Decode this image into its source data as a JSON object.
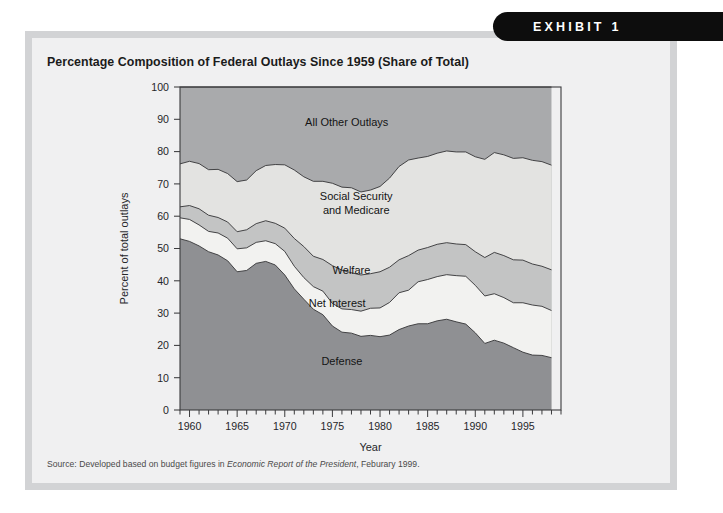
{
  "badge": {
    "label": "EXHIBIT 1"
  },
  "title": "Percentage Composition of Federal Outlays Since 1959 (Share of Total)",
  "source": {
    "prefix": "Source: Developed based on budget figures in ",
    "italic": "Economic Report of the President",
    "suffix": ", Feburary 1999."
  },
  "colors": {
    "page_background": "#ffffff",
    "frame": "#d2d3d5",
    "panel": "#f0f0f1",
    "badge": "#0d0d0d",
    "defense": "#8f9093",
    "net_interest": "#f2f2f0",
    "welfare": "#c3c4c4",
    "social_security": "#e3e3e1",
    "all_other": "#a9aaac",
    "outline": "#3b3b3d",
    "axis": "#3b3b3d"
  },
  "chart_data": {
    "type": "area",
    "title": "Percentage Composition of Federal Outlays Since 1959 (Share of Total)",
    "xlabel": "Year",
    "ylabel": "Percent of total outlays",
    "xlim": [
      1959,
      1999
    ],
    "ylim": [
      0,
      100
    ],
    "grid": false,
    "legend": "inline-band-labels",
    "stacked": true,
    "ytick_labels": [
      "0",
      "10",
      "20",
      "30",
      "40",
      "50",
      "60",
      "70",
      "80",
      "90",
      "100"
    ],
    "ytick_values": [
      0,
      10,
      20,
      30,
      40,
      50,
      60,
      70,
      80,
      90,
      100
    ],
    "xtick_labels": [
      "1960",
      "1965",
      "1970",
      "1975",
      "1980",
      "1985",
      "1990",
      "1995"
    ],
    "xtick_values": [
      1960,
      1965,
      1970,
      1975,
      1980,
      1985,
      1990,
      1995
    ],
    "x": [
      1959,
      1960,
      1961,
      1962,
      1963,
      1964,
      1965,
      1966,
      1967,
      1968,
      1969,
      1970,
      1971,
      1972,
      1973,
      1974,
      1975,
      1976,
      1977,
      1978,
      1979,
      1980,
      1981,
      1982,
      1983,
      1984,
      1985,
      1986,
      1987,
      1988,
      1989,
      1990,
      1991,
      1992,
      1993,
      1994,
      1995,
      1996,
      1997,
      1998
    ],
    "series": [
      {
        "name": "Defense",
        "label": "Defense",
        "color": "#8f9093",
        "values": [
          53.0,
          52.2,
          50.8,
          49.0,
          48.0,
          46.2,
          42.8,
          43.2,
          45.4,
          46.0,
          44.9,
          41.8,
          37.5,
          34.3,
          31.2,
          29.5,
          26.0,
          24.1,
          23.8,
          22.8,
          23.1,
          22.7,
          23.2,
          24.9,
          26.0,
          26.7,
          26.7,
          27.6,
          28.1,
          27.3,
          26.6,
          23.9,
          20.6,
          21.6,
          20.7,
          19.3,
          17.9,
          17.0,
          16.9,
          16.2
        ]
      },
      {
        "name": "Net Interest",
        "label": "Net Interest",
        "color": "#f2f2f0",
        "values": [
          6.5,
          6.8,
          6.5,
          6.3,
          6.8,
          7.0,
          7.1,
          7.0,
          6.5,
          6.4,
          6.6,
          7.3,
          7.0,
          6.7,
          7.0,
          7.3,
          7.0,
          7.2,
          7.3,
          7.8,
          8.4,
          8.9,
          10.1,
          11.4,
          11.1,
          13.0,
          13.7,
          13.7,
          13.8,
          14.3,
          14.8,
          14.7,
          14.7,
          14.4,
          14.1,
          13.9,
          15.3,
          15.5,
          15.2,
          14.6
        ]
      },
      {
        "name": "Welfare",
        "label": "Welfare",
        "color": "#c3c4c4",
        "values": [
          3.4,
          4.3,
          5.0,
          5.0,
          4.8,
          5.0,
          5.3,
          5.6,
          5.8,
          6.2,
          6.3,
          7.2,
          8.6,
          9.6,
          9.4,
          9.8,
          11.7,
          12.0,
          11.4,
          11.2,
          10.7,
          11.2,
          10.9,
          10.2,
          10.7,
          9.8,
          9.9,
          10.0,
          9.9,
          9.8,
          9.8,
          10.4,
          11.9,
          12.8,
          13.0,
          13.3,
          13.2,
          12.7,
          12.4,
          12.6
        ]
      },
      {
        "name": "Social Security and Medicare",
        "label": "Social Security\nand Medicare",
        "color": "#e3e3e1",
        "values": [
          13.3,
          13.7,
          14.0,
          14.1,
          14.9,
          15.0,
          15.5,
          15.4,
          16.4,
          17.1,
          18.2,
          19.6,
          21.2,
          21.6,
          23.2,
          24.2,
          25.5,
          25.7,
          26.3,
          25.7,
          25.9,
          26.4,
          27.6,
          28.9,
          29.6,
          28.5,
          28.2,
          28.2,
          28.4,
          28.5,
          28.7,
          29.4,
          30.4,
          30.9,
          31.2,
          31.4,
          31.7,
          32.1,
          32.4,
          32.4
        ]
      },
      {
        "name": "All Other Outlays",
        "label": "All Other Outlays",
        "color": "#a9aaac",
        "values": [
          23.8,
          23.0,
          23.7,
          25.6,
          25.5,
          26.8,
          29.3,
          28.8,
          25.9,
          24.3,
          24.0,
          24.1,
          25.7,
          27.8,
          29.2,
          29.2,
          29.8,
          31.0,
          31.2,
          32.5,
          31.9,
          30.8,
          28.2,
          24.6,
          22.6,
          22.0,
          21.5,
          20.5,
          19.8,
          20.1,
          20.1,
          21.6,
          22.4,
          20.3,
          21.0,
          22.1,
          21.9,
          22.7,
          23.1,
          24.2
        ]
      }
    ],
    "band_label_positions": [
      {
        "name": "All Other Outlays",
        "x": 1976.5,
        "y": 88.0
      },
      {
        "name": "Social Security",
        "x": 1977.5,
        "y": 65.0
      },
      {
        "name": "and Medicare",
        "x": 1977.5,
        "y": 60.8
      },
      {
        "name": "Welfare",
        "x": 1977.0,
        "y": 42.0
      },
      {
        "name": "Net Interest",
        "x": 1975.5,
        "y": 32.0
      },
      {
        "name": "Defense",
        "x": 1976.0,
        "y": 14.0
      }
    ]
  }
}
